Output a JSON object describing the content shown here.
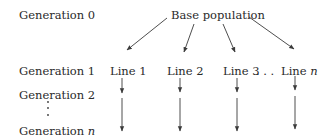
{
  "diagram": {
    "type": "tree",
    "generations": [
      {
        "label": "Generation ",
        "index": "0"
      },
      {
        "label": "Generation ",
        "index": "1"
      },
      {
        "label": "Generation ",
        "index": "2"
      },
      {
        "label": "Generation ",
        "index": "n"
      }
    ],
    "root": {
      "label": "Base population"
    },
    "lines": [
      {
        "label": "Line ",
        "index": "1"
      },
      {
        "label": "Line ",
        "index": "2"
      },
      {
        "label": "Line ",
        "index": "3"
      },
      {
        "label": "Line ",
        "index": "n"
      }
    ],
    "ellipsis": ". . .",
    "vertical_ellipsis": "⋮",
    "edges": [
      {
        "from": "Base population",
        "to": "Line 1"
      },
      {
        "from": "Base population",
        "to": "Line 2"
      },
      {
        "from": "Base population",
        "to": "Line 3"
      },
      {
        "from": "Base population",
        "to": "Line n"
      },
      {
        "from": "Line 1",
        "to": "Generation 2"
      },
      {
        "from": "Line 2",
        "to": "Generation 2"
      },
      {
        "from": "Line 3",
        "to": "Generation 2"
      },
      {
        "from": "Line n",
        "to": "Generation 2"
      },
      {
        "from": "Generation 2",
        "to": "Generation n"
      }
    ],
    "colors": {
      "text": "#2a2a2a",
      "arrow": "#3a3a3a",
      "background": "#ffffff"
    }
  }
}
